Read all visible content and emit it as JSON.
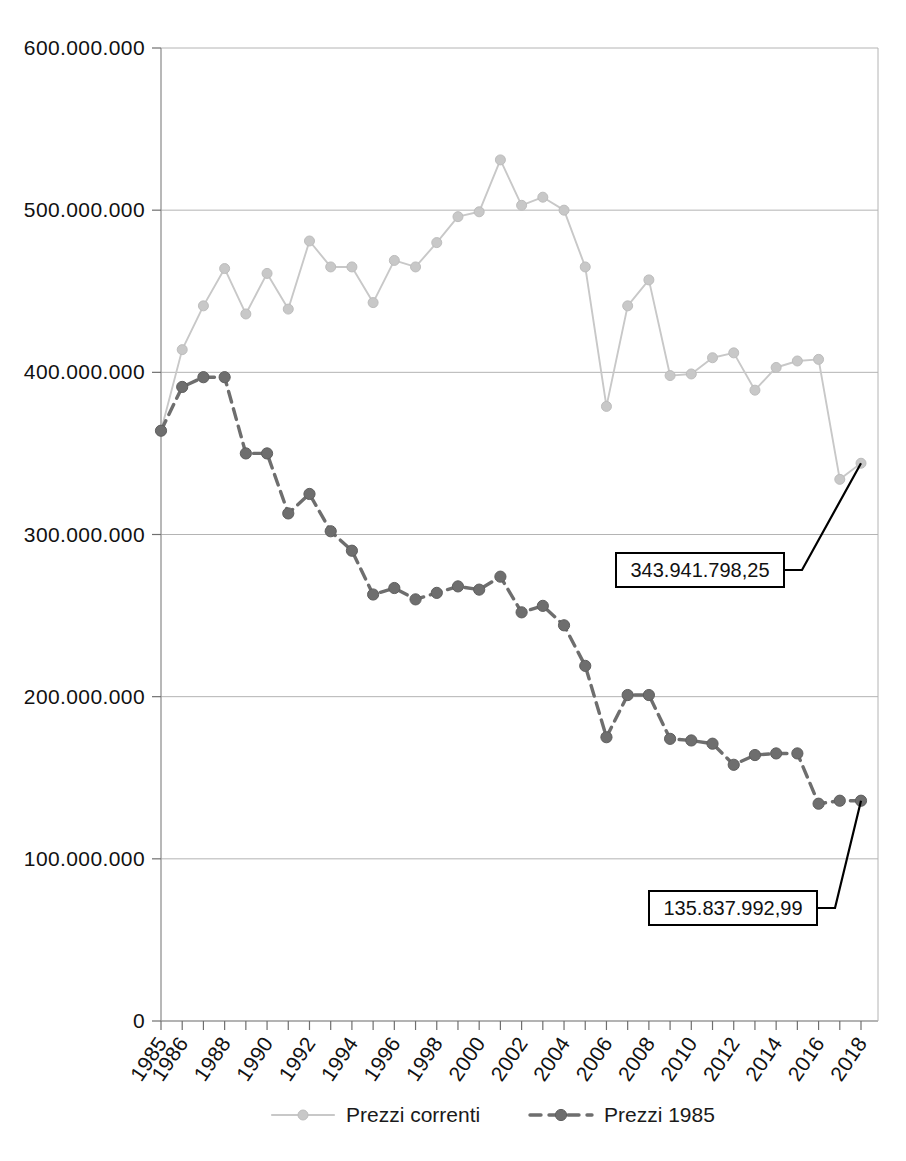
{
  "chart_data": {
    "type": "line",
    "title": "",
    "subtitle": "",
    "xlabel": "",
    "ylabel": "",
    "x": [
      1985,
      1986,
      1987,
      1988,
      1989,
      1990,
      1991,
      1992,
      1993,
      1994,
      1995,
      1996,
      1997,
      1998,
      1999,
      2000,
      2001,
      2002,
      2003,
      2004,
      2005,
      2006,
      2007,
      2008,
      2009,
      2010,
      2011,
      2012,
      2013,
      2014,
      2015,
      2016,
      2017,
      2018
    ],
    "xlim": [
      1985,
      2018
    ],
    "ylim": [
      0,
      600000000
    ],
    "yticks": [
      0,
      100000000,
      200000000,
      300000000,
      400000000,
      500000000,
      600000000
    ],
    "ytick_labels": [
      "0",
      "100.000.000",
      "200.000.000",
      "300.000.000",
      "400.000.000",
      "500.000.000",
      "600.000.000"
    ],
    "xtick_labels": [
      "1985",
      "1986",
      "",
      "1988",
      "",
      "1990",
      "",
      "1992",
      "",
      "1994",
      "",
      "1996",
      "",
      "1998",
      "",
      "2000",
      "",
      "2002",
      "",
      "2004",
      "",
      "2006",
      "",
      "2008",
      "",
      "2010",
      "",
      "2012",
      "",
      "2014",
      "",
      "2016",
      "",
      "2018"
    ],
    "grid": true,
    "legend_position": "bottom",
    "series": [
      {
        "name": "Prezzi correnti",
        "color": "#c8c8c8",
        "style": "solid",
        "marker": "circle",
        "values": [
          364000000,
          414000000,
          441000000,
          464000000,
          436000000,
          461000000,
          439000000,
          481000000,
          465000000,
          465000000,
          443000000,
          469000000,
          465000000,
          480000000,
          496000000,
          499000000,
          531000000,
          503000000,
          508000000,
          500000000,
          465000000,
          379000000,
          441000000,
          457000000,
          398000000,
          399000000,
          409000000,
          412000000,
          389000000,
          403000000,
          407000000,
          408000000,
          334000000,
          343941798
        ]
      },
      {
        "name": "Prezzi 1985",
        "color": "#6e6e6e",
        "style": "dashed",
        "marker": "circle",
        "values": [
          364000000,
          391000000,
          397000000,
          397000000,
          350000000,
          350000000,
          313000000,
          325000000,
          302000000,
          290000000,
          263000000,
          267000000,
          260000000,
          264000000,
          268000000,
          266000000,
          274000000,
          252000000,
          256000000,
          244000000,
          219000000,
          175000000,
          201000000,
          201000000,
          174000000,
          173000000,
          171000000,
          158000000,
          164000000,
          165000000,
          165000000,
          134000000,
          135837993,
          135837993
        ]
      }
    ],
    "annotations": [
      {
        "name": "prezzi-correnti-final-value",
        "label": "343.941.798,25",
        "target_x": 2018,
        "target_y": 343941798,
        "box_cx": 700,
        "box_cy": 570,
        "box_w": 168,
        "box_h": 34
      },
      {
        "name": "prezzi-1985-final-value",
        "label": "135.837.992,99",
        "target_x": 2018,
        "target_y": 135837993,
        "box_cx": 733,
        "box_cy": 908,
        "box_w": 168,
        "box_h": 34
      }
    ]
  },
  "legend": {
    "items": [
      {
        "label": "Prezzi correnti",
        "color": "#c8c8c8",
        "style": "solid"
      },
      {
        "label": "Prezzi 1985",
        "color": "#6e6e6e",
        "style": "dashed"
      }
    ]
  }
}
